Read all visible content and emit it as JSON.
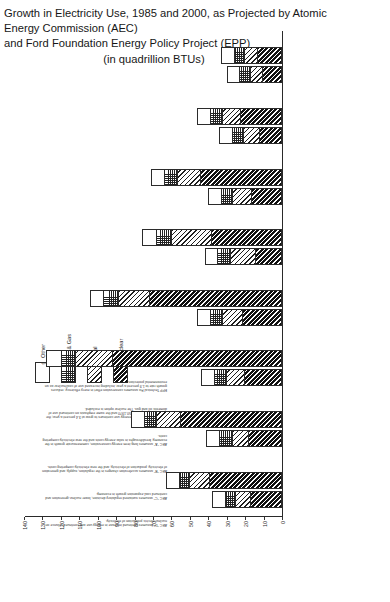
{
  "title": {
    "line1": "Growth in Electricity Use, 1985 and 2000, as Projected by Atomic Energy Commission (AEC)",
    "line2": "and Ford Foundation Energy Policy Project (EPP)",
    "subtitle": "(in quadrillion BTUs)"
  },
  "legend": {
    "items": [
      {
        "label": "Other",
        "pattern": "f-other"
      },
      {
        "label": "Oil & Gas",
        "pattern": "f-oil"
      },
      {
        "label": "Coal",
        "pattern": "f-coal"
      },
      {
        "label": "Nuclear",
        "pattern": "f-nuc"
      }
    ]
  },
  "notes": [
    {
      "text": "AEC \"D\" assumes continued increase in energy use and continued reliance on nuclear-electric production of electricity."
    },
    {
      "text": "AEC \"C\" assumes sustained regulatory decision, lower nuclear-generation and continued coal-expansion growth in economy."
    },
    {
      "text": "AEC \"B\" assumes acceleration changes in the regulation, supply, and generation of electricity, production of electricity, and the new electricity-competing costs."
    },
    {
      "text": "AEC \"A\" assumes long-term energy conservation, commensurate growth in the economy, breakthroughs in solar-energy costs and the new electricity-competing costs."
    },
    {
      "text": "EPP Historic assumes energy use continues to grow at 3.4 percent a year, the average growth rate 1950-1970 and the same emphasis on continued use of domestic oil and gas. The nuclear option is excluded."
    },
    {
      "text": "EPP Technical Fix assumes conservation effort in every efficiency; reduces growth rate to 1.9 percent a year, including increased use of coal/nuclear as an environmental protection."
    },
    {
      "text": "EPP Zero Energy Growth assumes total energy use levels off after 1985, but with added emphasis on solar/renewable growth away from energy-intensive industries."
    }
  ],
  "chart_data": {
    "type": "bar",
    "title": "Growth in Electricity Use, 1985 and 2000, as Projected by Atomic Energy Commission (AEC) and Ford Foundation Energy Policy Project (EPP)",
    "xlabel": "",
    "ylabel": "quadrillion BTUs",
    "ylim": [
      0,
      140
    ],
    "yticks": [
      0,
      10,
      20,
      30,
      40,
      50,
      60,
      70,
      80,
      90,
      100,
      110,
      120,
      130,
      140
    ],
    "grid": false,
    "legend_position": "top-right",
    "stack_order": [
      "Nuclear",
      "Coal",
      "Oil & Gas",
      "Other"
    ],
    "series": [
      {
        "name": "Nuclear",
        "pattern": "f-nuc"
      },
      {
        "name": "Coal",
        "pattern": "f-coal"
      },
      {
        "name": "Oil & Gas",
        "pattern": "f-oil"
      },
      {
        "name": "Other",
        "pattern": "f-other"
      }
    ],
    "groups": [
      {
        "category": "AEC \"A\"",
        "years": [
          "1985",
          "2000"
        ],
        "bars": [
          {
            "year": "1985",
            "total": 38,
            "values": {
              "Nuclear": 17,
              "Coal": 8,
              "Oil & Gas": 6,
              "Other": 7
            }
          },
          {
            "year": "2000",
            "total": 63,
            "values": {
              "Nuclear": 39,
              "Coal": 11,
              "Oil & Gas": 6,
              "Other": 7
            }
          }
        ]
      },
      {
        "category": "AEC \"B\"",
        "years": [
          "1985",
          "2000"
        ],
        "bars": [
          {
            "year": "1985",
            "total": 41,
            "values": {
              "Nuclear": 18,
              "Coal": 9,
              "Oil & Gas": 7,
              "Other": 7
            }
          },
          {
            "year": "2000",
            "total": 82,
            "values": {
              "Nuclear": 55,
              "Coal": 13,
              "Oil & Gas": 7,
              "Other": 7
            }
          }
        ]
      },
      {
        "category": "AEC \"C\"",
        "years": [
          "1985",
          "2000"
        ],
        "bars": [
          {
            "year": "1985",
            "total": 44,
            "values": {
              "Nuclear": 20,
              "Coal": 10,
              "Oil & Gas": 7,
              "Other": 7
            }
          },
          {
            "year": "2000",
            "total": 128,
            "values": {
              "Nuclear": 92,
              "Coal": 20,
              "Oil & Gas": 8,
              "Other": 8
            }
          }
        ]
      },
      {
        "category": "AEC \"D\"",
        "years": [
          "1985",
          "2000"
        ],
        "bars": [
          {
            "year": "1985",
            "total": 46,
            "values": {
              "Nuclear": 21,
              "Coal": 11,
              "Oil & Gas": 7,
              "Other": 7
            }
          },
          {
            "year": "2000",
            "total": 104,
            "values": {
              "Nuclear": 72,
              "Coal": 17,
              "Oil & Gas": 8,
              "Other": 7
            }
          }
        ]
      },
      {
        "category": "EPP Historical — Zero/Solar — Oil & Gas",
        "years": [
          "1985",
          "2000"
        ],
        "bars": [
          {
            "year": "1985",
            "total": 42,
            "values": {
              "Nuclear": 14,
              "Coal": 14,
              "Oil & Gas": 7,
              "Other": 7
            }
          },
          {
            "year": "2000",
            "total": 76,
            "values": {
              "Nuclear": 38,
              "Coal": 22,
              "Oil & Gas": 8,
              "Other": 8
            }
          }
        ]
      },
      {
        "category": "EPP Historical — Nuclear",
        "years": [
          "1985",
          "2000"
        ],
        "bars": [
          {
            "year": "1985",
            "total": 40,
            "values": {
              "Nuclear": 16,
              "Coal": 11,
              "Oil & Gas": 6,
              "Other": 7
            }
          },
          {
            "year": "2000",
            "total": 71,
            "values": {
              "Nuclear": 44,
              "Coal": 13,
              "Oil & Gas": 7,
              "Other": 7
            }
          }
        ]
      },
      {
        "category": "EPP Transitional — Zero-Solar — Sufficiencies",
        "years": [
          "1985",
          "2000"
        ],
        "bars": [
          {
            "year": "1985",
            "total": 34,
            "values": {
              "Nuclear": 12,
              "Coal": 9,
              "Oil & Gas": 6,
              "Other": 7
            }
          },
          {
            "year": "2000",
            "total": 46,
            "values": {
              "Nuclear": 22,
              "Coal": 10,
              "Oil & Gas": 7,
              "Other": 7
            }
          }
        ]
      },
      {
        "category": "EPP Zero Energy Growth",
        "years": [
          "1985",
          "2000"
        ],
        "bars": [
          {
            "year": "1985",
            "total": 30,
            "values": {
              "Nuclear": 10,
              "Coal": 7,
              "Oil & Gas": 6,
              "Other": 7
            }
          },
          {
            "year": "2000",
            "total": 33,
            "values": {
              "Nuclear": 13,
              "Coal": 7,
              "Oil & Gas": 6,
              "Other": 7
            }
          }
        ]
      }
    ]
  }
}
